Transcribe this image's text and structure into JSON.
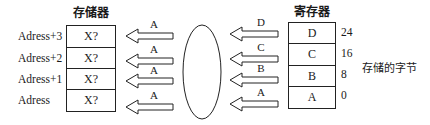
{
  "memory": {
    "title": "存储器",
    "addresses": [
      "Adress+3",
      "Adress+2",
      "Adress+1",
      "Adress"
    ],
    "cells": [
      "X?",
      "X?",
      "X?",
      "X?"
    ]
  },
  "left_arrows": {
    "labels": [
      "A",
      "A",
      "A",
      "A"
    ]
  },
  "right_arrows": {
    "labels": [
      "D",
      "C",
      "B",
      "A"
    ]
  },
  "register": {
    "title": "寄存器",
    "cells": [
      "D",
      "C",
      "B",
      "A"
    ],
    "bit_offsets": [
      "24",
      "16",
      "8",
      "0"
    ]
  },
  "caption": "存储的字节",
  "colors": {
    "stroke": "#222222",
    "background": "#ffffff"
  }
}
